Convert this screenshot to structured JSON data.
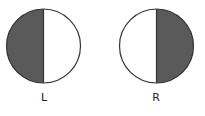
{
  "diagram": {
    "fill_color": "#5a5a5a",
    "stroke_color": "#333333",
    "circles": [
      {
        "label": "L",
        "shaded_half": "left"
      },
      {
        "label": "R",
        "shaded_half": "right"
      }
    ]
  }
}
